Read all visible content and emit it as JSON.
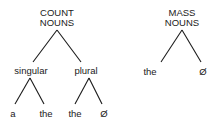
{
  "diagram": {
    "type": "tree",
    "trees": [
      {
        "root": {
          "line1": "COUNT",
          "line2": "NOUNS"
        },
        "children": [
          {
            "label": "singular",
            "children": [
              {
                "label": "a"
              },
              {
                "label": "the"
              }
            ]
          },
          {
            "label": "plural",
            "children": [
              {
                "label": "the"
              },
              {
                "label": "Ø"
              }
            ]
          }
        ]
      },
      {
        "root": {
          "line1": "MASS",
          "line2": "NOUNS"
        },
        "children": [
          {
            "label": "the"
          },
          {
            "label": "Ø"
          }
        ]
      }
    ]
  },
  "colors": {
    "line": "#1a1a1a",
    "text": "#1a1a1a",
    "background": "#ffffff"
  }
}
